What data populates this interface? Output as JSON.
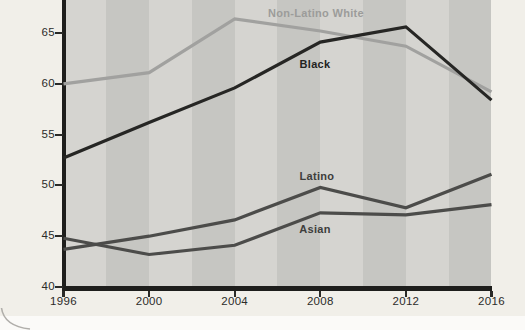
{
  "chart_data": {
    "type": "line",
    "title": "",
    "xlabel": "",
    "ylabel": "",
    "x": [
      1996,
      2000,
      2004,
      2008,
      2012,
      2016
    ],
    "x_tick_labels": [
      "1996",
      "2000",
      "2004",
      "2008",
      "2012",
      "2016"
    ],
    "yticks": [
      65,
      60,
      55,
      50,
      45,
      40
    ],
    "y_tick_labels": [
      "65",
      "60",
      "55",
      "50",
      "45",
      "40"
    ],
    "ylim": [
      40,
      68.5
    ],
    "grid": "vertical-stripes",
    "legend_position": "inline-labels",
    "series": [
      {
        "name": "Non-Latino White",
        "color": "#a1a19f",
        "values": [
          60.0,
          61.1,
          66.4,
          65.2,
          63.7,
          59.2
        ]
      },
      {
        "name": "Black",
        "color": "#262624",
        "values": [
          52.7,
          56.2,
          59.6,
          64.1,
          65.6,
          58.4
        ]
      },
      {
        "name": "Latino",
        "color": "#4c4c4a",
        "values": [
          43.7,
          45.0,
          46.6,
          49.8,
          47.8,
          51.1
        ]
      },
      {
        "name": "Asian",
        "color": "#4c4c4a",
        "values": [
          44.8,
          43.2,
          44.1,
          47.3,
          47.1,
          48.1
        ]
      }
    ],
    "layout": {
      "stripe_light": "#d5d4d0",
      "stripe_dark": "#c6c6c2",
      "axis_color": "#1e1e1c",
      "card_background": "#f1efe9",
      "page_background": "#fbfaf8",
      "corner_arc_color": "#b0aeaa",
      "stripe_count": 10
    }
  }
}
